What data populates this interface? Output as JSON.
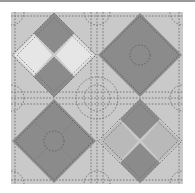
{
  "image": {
    "description": "Quilt pattern: 2x2 grid of on-point diamond blocks with dashed quilting stitches",
    "colors": {
      "background": "#c9c9c9",
      "dark": "#8b8b8b",
      "light": "#e6e6e6",
      "medium": "#b9b9b9",
      "stitch": "#6a6a6a",
      "frame_line": "#9a9a9a"
    },
    "blocks": [
      {
        "position": "top-left",
        "type": "bowtie",
        "top": "dark",
        "bottom": "dark",
        "left": "light",
        "right": "light"
      },
      {
        "position": "top-right",
        "type": "solid-diamond-with-circle",
        "fill": "dark"
      },
      {
        "position": "bottom-left",
        "type": "solid-diamond-with-circle",
        "fill": "dark"
      },
      {
        "position": "bottom-right",
        "type": "bowtie",
        "top": "dark",
        "bottom": "dark",
        "left": "medium",
        "right": "medium"
      }
    ],
    "center_motif": "dashed circle medallion"
  }
}
